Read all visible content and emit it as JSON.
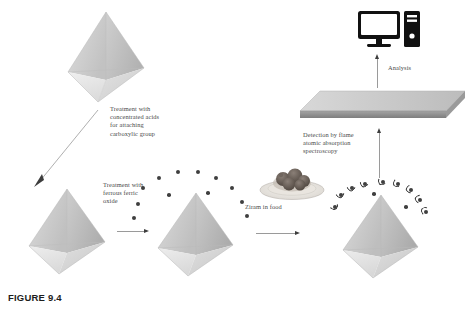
{
  "figure": {
    "caption": "FIGURE 9.4",
    "background_color": "#ffffff"
  },
  "labels": {
    "step1": "Treatment with\nconcentrated acids\nfor attaching\ncarboxylic group",
    "step2": "Treatment with\nferrous ferric\noxide",
    "step3": "Ziram in food",
    "step4": "Detection by flame\natomic absorption\nspectroscopy",
    "step5": "Analysis"
  },
  "nodes": {
    "crystal_top": "pristine-nanocrystal",
    "crystal_left": "carboxylated-nanocrystal",
    "crystal_middle": "magnetite-functionalized-nanocrystal",
    "crystal_right": "ziram-adsorbed-nanocrystal",
    "food_plate": "ziram-contaminated-food",
    "instrument": "flame-atomic-absorption-spectrometer",
    "computer": "analysis-computer"
  },
  "colors": {
    "crystal_light": "#e8e8e8",
    "crystal_mid": "#c9c9c9",
    "crystal_dark": "#a8a8a8",
    "particle": "#3f3f3f",
    "arrow": "#9a9a9a",
    "arrow_head": "#3d3d3d",
    "text": "#4a4a4a",
    "caption": "#1d1d1d",
    "slab_top": "#d4d4d4",
    "slab_face": "#8f8f8f",
    "computer": "#1a1a1a"
  },
  "counts": {
    "middle_particles": 12,
    "right_particles": 11
  }
}
